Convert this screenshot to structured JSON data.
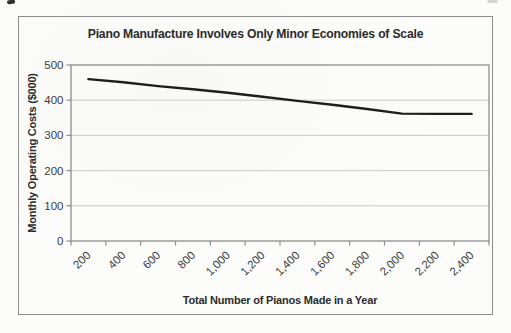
{
  "figure": {
    "title": "Piano Manufacture Involves Only Minor Economies of Scale",
    "x_axis_title": "Total Number of Pianos Made in a Year",
    "y_axis_title": "Monthly Operating Costs ($000)"
  },
  "chart_data": {
    "type": "line",
    "title": "Piano Manufacture Involves Only Minor Economies of Scale",
    "xlabel": "Total Number of Pianos Made in a Year",
    "ylabel": "Monthly Operating Costs ($000)",
    "categories": [
      "200",
      "400",
      "600",
      "800",
      "1,000",
      "1,200",
      "1,400",
      "1,600",
      "1,800",
      "2,000",
      "2,200",
      "2,400"
    ],
    "x_values": [
      200,
      400,
      600,
      800,
      1000,
      1200,
      1400,
      1600,
      1800,
      2000,
      2200,
      2400
    ],
    "values": [
      460,
      451,
      440,
      431,
      421,
      410,
      398,
      387,
      375,
      362,
      361,
      361
    ],
    "y_ticks": [
      "0",
      "100",
      "200",
      "300",
      "400",
      "500"
    ],
    "ylim": [
      0,
      500
    ],
    "grid": "horizontal",
    "legend": "none",
    "x_label_rotation_deg": -45,
    "colors": {
      "line": "#1e1e1e",
      "grid": "#c9c9c9",
      "frame": "#8d8d8d",
      "tick_text": "#3c3c3c",
      "title_text": "#2b2b2b"
    }
  }
}
